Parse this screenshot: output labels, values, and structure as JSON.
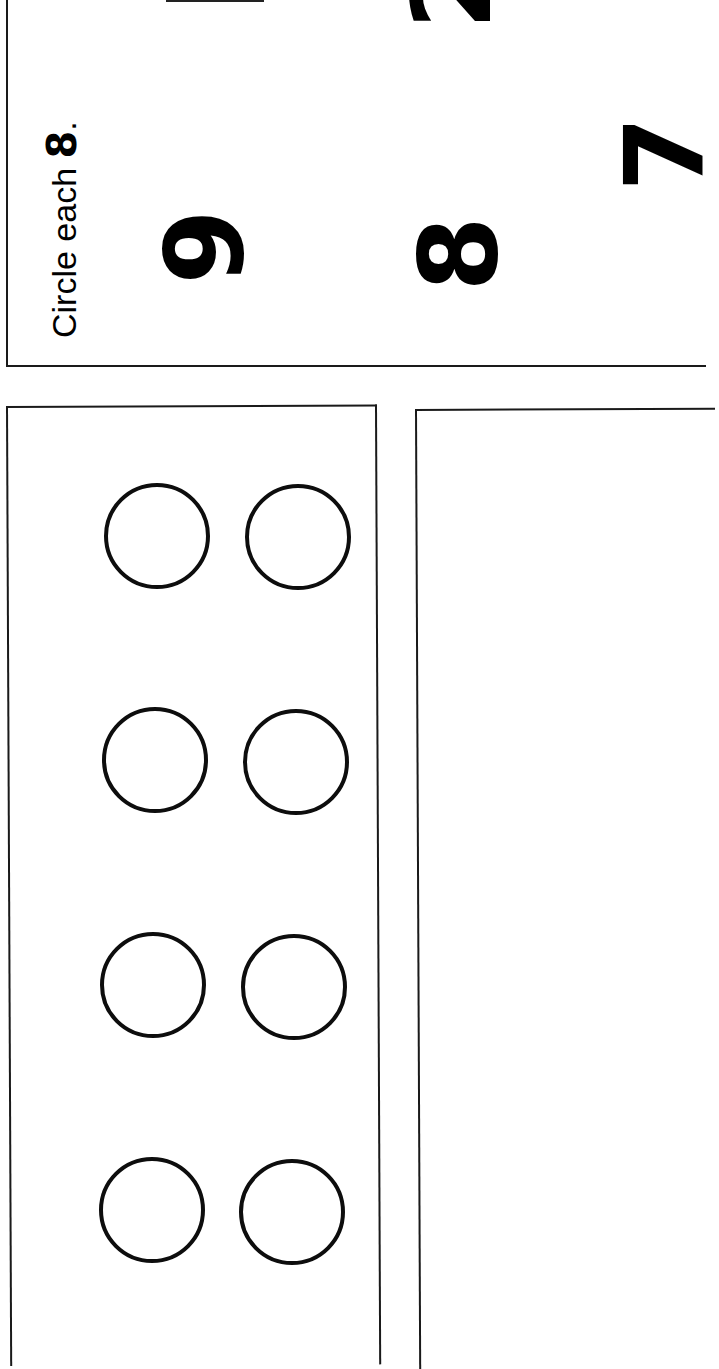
{
  "worksheet": {
    "orientation": "rotated 90 degrees (text reads bottom-to-top)",
    "instruction": {
      "prefix": "Circle each ",
      "target_digit": "8",
      "suffix": "."
    },
    "digit_choices": [
      {
        "value": "9",
        "fully_visible": true
      },
      {
        "value": "8",
        "fully_visible": true
      },
      {
        "value": "2",
        "fully_visible": false
      },
      {
        "value": "7",
        "fully_visible": false
      }
    ],
    "ten_frame": {
      "rows": 4,
      "columns": 2,
      "empty_circles": 8,
      "filled_circles": 0
    },
    "blank_box": {
      "content": ""
    }
  }
}
